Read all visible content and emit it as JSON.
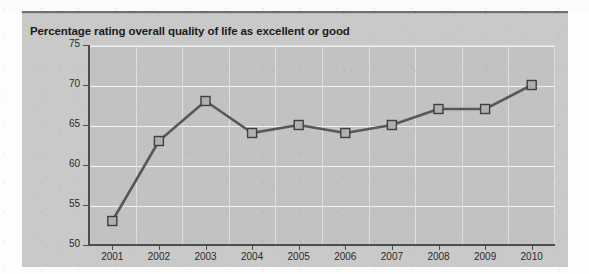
{
  "chart_data": {
    "type": "line",
    "title": "Percentage rating overall quality of life as excellent or good",
    "xlabel": "",
    "ylabel": "",
    "categories": [
      "2001",
      "2002",
      "2003",
      "2004",
      "2005",
      "2006",
      "2007",
      "2008",
      "2009",
      "2010"
    ],
    "values": [
      53,
      63,
      68,
      64,
      65,
      64,
      65,
      67,
      67,
      70
    ],
    "series": [
      {
        "name": "Percentage rating overall quality of life as excellent or good",
        "values": [
          53,
          63,
          68,
          64,
          65,
          64,
          65,
          67,
          67,
          70
        ]
      }
    ],
    "ylim": [
      50,
      75
    ],
    "yticks": [
      50,
      55,
      60,
      65,
      70,
      75
    ],
    "ytick_labels": [
      "50",
      "55",
      "60",
      "65",
      "70",
      "75"
    ],
    "xtick_labels": [
      "2001",
      "2002",
      "2003",
      "2004",
      "2005",
      "2006",
      "2007",
      "2008",
      "2009",
      "2010"
    ],
    "grid": true,
    "legend": false,
    "legend_position": "none",
    "marker": "square",
    "colors": {
      "line": "#585858",
      "marker_fill": "#b0b0b0",
      "marker_stroke": "#3f3f3f",
      "plot_background": "#c2c2c2",
      "panel_background": "#c9c9c9",
      "gridline": "#f2f2f2",
      "axis": "#4d4d4d",
      "title_text": "#1b1b1b",
      "tick_text": "#2a2a2a",
      "top_rule": "#6e6e6e"
    }
  }
}
